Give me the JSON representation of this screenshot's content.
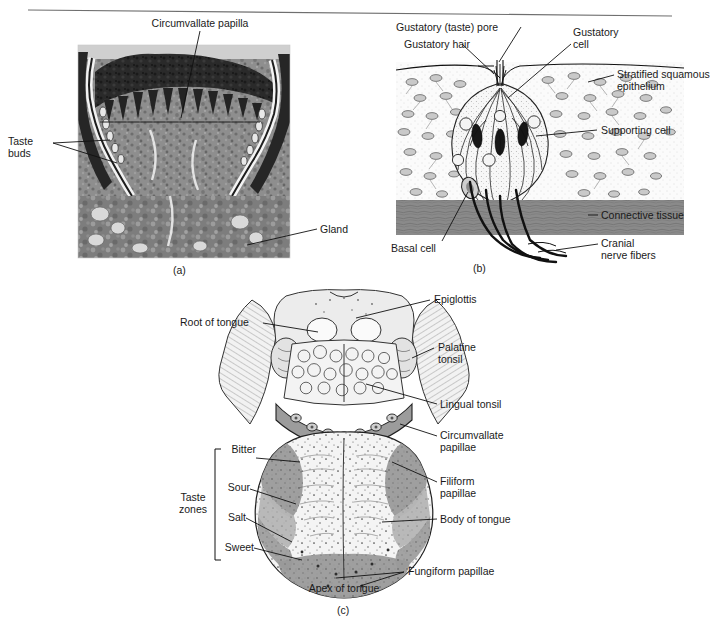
{
  "figure": {
    "title_rule": "horizontal-divider",
    "panels": [
      {
        "id": "a",
        "caption": "(a)",
        "type": "light-micrograph",
        "description": "Histological section of a circumvallate papilla showing taste buds and glands",
        "labels": [
          {
            "name": "circumvallate-papilla",
            "text": "Circumvallate papilla"
          },
          {
            "name": "taste-buds",
            "text": "Taste\nbuds"
          },
          {
            "name": "gland",
            "text": "Gland"
          }
        ]
      },
      {
        "id": "b",
        "caption": "(b)",
        "type": "line-diagram",
        "description": "Enlarged diagram of a taste bud within stratified squamous epithelium",
        "labels": [
          {
            "name": "gustatory-taste-pore",
            "text": "Gustatory (taste) pore"
          },
          {
            "name": "gustatory-hair",
            "text": "Gustatory hair"
          },
          {
            "name": "gustatory-cell",
            "text": "Gustatory\ncell"
          },
          {
            "name": "stratified-squamous-epithelium",
            "text": "Stratified squamous\nepithelium"
          },
          {
            "name": "supporting-cell",
            "text": "Supporting cell"
          },
          {
            "name": "connective-tissue",
            "text": "Connective tissue"
          },
          {
            "name": "cranial-nerve-fibers",
            "text": "Cranial\nnerve fibers"
          },
          {
            "name": "basal-cell",
            "text": "Basal cell"
          }
        ]
      },
      {
        "id": "c",
        "caption": "(c)",
        "type": "line-diagram",
        "description": "Dorsal surface of the tongue showing papillae, tonsils and taste zones",
        "labels": [
          {
            "name": "epiglottis",
            "text": "Epiglottis"
          },
          {
            "name": "root-of-tongue",
            "text": "Root of tongue"
          },
          {
            "name": "palatine-tonsil",
            "text": "Palatine\ntonsil"
          },
          {
            "name": "lingual-tonsil",
            "text": "Lingual tonsil"
          },
          {
            "name": "circumvallate-papillae",
            "text": "Circumvallate\npapillae"
          },
          {
            "name": "filiform-papillae",
            "text": "Filiform\npapillae"
          },
          {
            "name": "body-of-tongue",
            "text": "Body of tongue"
          },
          {
            "name": "fungiform-papillae",
            "text": "Fungiform papillae"
          },
          {
            "name": "apex-of-tongue",
            "text": "Apex of tongue"
          }
        ],
        "taste_zones": {
          "group_label": "Taste\nzones",
          "items": [
            {
              "name": "bitter",
              "text": "Bitter"
            },
            {
              "name": "sour",
              "text": "Sour"
            },
            {
              "name": "salt",
              "text": "Salt"
            },
            {
              "name": "sweet",
              "text": "Sweet"
            }
          ]
        }
      }
    ]
  },
  "colors": {
    "ink": "#1a1a1a",
    "rule": "#6f6f6f",
    "connective_tissue": "#8a8a8a",
    "taste_zone_dark": "#9a9a9a",
    "taste_zone_mid": "#b3b3b3",
    "tongue_body": "#efefef",
    "tonsil_fill": "#e2e2e2"
  }
}
